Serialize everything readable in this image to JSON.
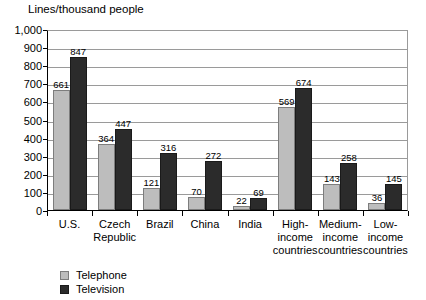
{
  "chart_data": {
    "type": "bar",
    "title": "",
    "ylabel": "Lines/thousand people",
    "xlabel": "",
    "ylim": [
      0,
      1000
    ],
    "ytick_step": 100,
    "ytick_labels": [
      "1,000",
      "900",
      "800",
      "700",
      "600",
      "500",
      "400",
      "300",
      "200",
      "100",
      "0"
    ],
    "grid": true,
    "legend_position": "bottom-left",
    "categories": [
      "U.S.",
      "Czech\nRepublic",
      "Brazil",
      "China",
      "India",
      "High-\nincome\ncountries",
      "Medium-\nincome\ncountries",
      "Low-\nincome\ncountries"
    ],
    "series": [
      {
        "name": "Telephone",
        "color": "#bdbdbd",
        "values": [
          661,
          364,
          121,
          70,
          22,
          569,
          143,
          36
        ]
      },
      {
        "name": "Television",
        "color": "#2b2b2b",
        "values": [
          847,
          447,
          316,
          272,
          69,
          674,
          258,
          145
        ]
      }
    ]
  },
  "legend": {
    "items": [
      {
        "label": "Telephone",
        "swatch": "telephone"
      },
      {
        "label": "Television",
        "swatch": "television"
      }
    ]
  }
}
